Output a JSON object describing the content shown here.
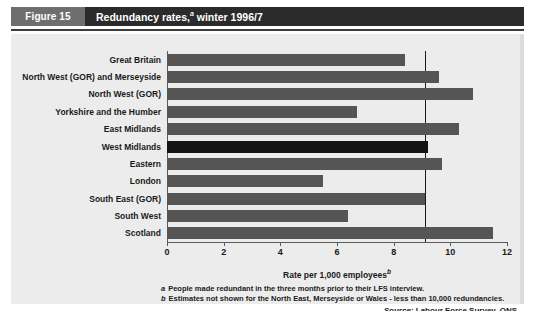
{
  "figure": {
    "number_label": "Figure 15",
    "title": "Redundancy rates,",
    "title_superscript": "a",
    "title_tail": " winter 1996/7"
  },
  "footnotes": [
    {
      "marker": "a",
      "text": "People made redundant in the three months prior to their LFS interview."
    },
    {
      "marker": "b",
      "text": "Estimates not shown for the North East, Merseyside or Wales - less than 10,000 redundancies."
    }
  ],
  "source": {
    "label": "Source:",
    "text": "Labour Force Survey, ONS"
  },
  "colors": {
    "bar": "#555555",
    "bar_highlight": "#141414",
    "panel_background": "#ececec",
    "title_bar": "#2b2b2b",
    "title_tag": "#6e6e6e",
    "reference_line": "#1a1a1a"
  },
  "chart_data": {
    "type": "bar",
    "orientation": "horizontal",
    "xlabel": "Rate per 1,000 employees",
    "xlabel_superscript": "b",
    "ylabel": "",
    "xlim": [
      0,
      12
    ],
    "xticks": [
      0,
      2,
      4,
      6,
      8,
      10,
      12
    ],
    "xtick_labels": [
      "0",
      "2",
      "4",
      "6",
      "8",
      "10",
      "12"
    ],
    "grid": false,
    "legend": false,
    "reference_line_value": 9.1,
    "highlight_category": "West Midlands",
    "categories": [
      "Great Britain",
      "North West (GOR) and Merseyside",
      "North West (GOR)",
      "Yorkshire and the Humber",
      "East Midlands",
      "West Midlands",
      "Eastern",
      "London",
      "South East (GOR)",
      "South West",
      "Scotland"
    ],
    "values": [
      8.4,
      9.6,
      10.8,
      6.7,
      10.3,
      9.2,
      9.7,
      5.5,
      9.1,
      6.4,
      11.5
    ]
  }
}
